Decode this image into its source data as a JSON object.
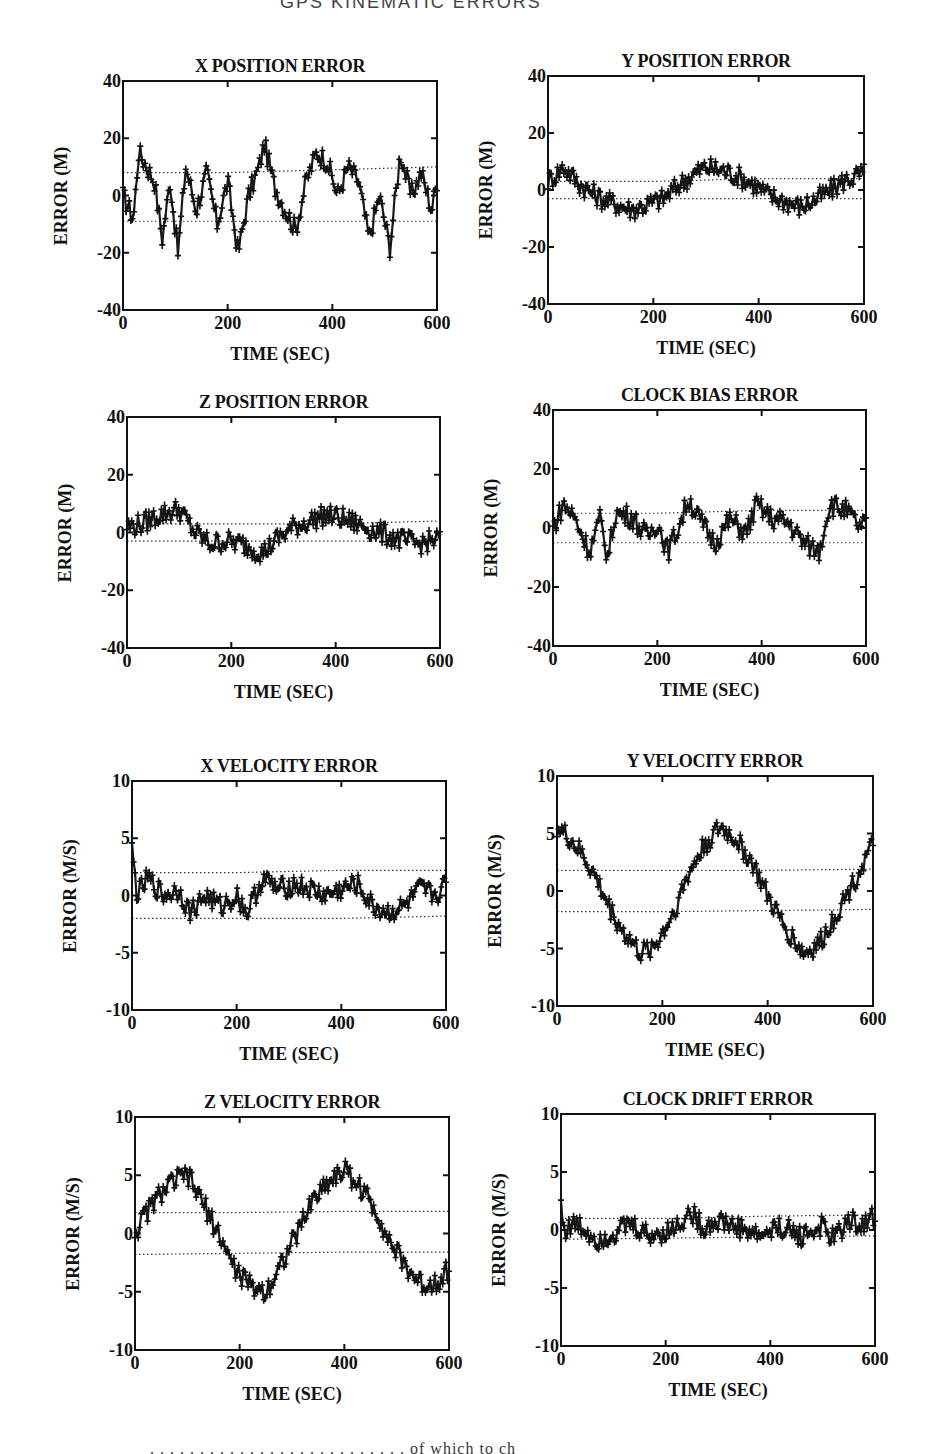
{
  "page": {
    "top_partial_text": "GPS KINEMATIC ERRORS",
    "bottom_partial_text": ". . . . . . . . . . . . . . . . . . . . . . . . . . of which to ch"
  },
  "panels": [
    {
      "id": "x-position",
      "title": "X POSITION ERROR",
      "ylabel": "ERROR (M)",
      "xlabel": "TIME (SEC)",
      "frame": {
        "left": 123,
        "top": 81,
        "right": 437,
        "bottom": 310
      },
      "yticks": [
        "40",
        "20",
        "0",
        "-20",
        "-40"
      ],
      "xticks": [
        "0",
        "200",
        "400",
        "600"
      ]
    },
    {
      "id": "y-position",
      "title": "Y POSITION ERROR",
      "ylabel": "ERROR (M)",
      "xlabel": "TIME (SEC)",
      "frame": {
        "left": 548,
        "top": 76,
        "right": 864,
        "bottom": 304
      },
      "yticks": [
        "40",
        "20",
        "0",
        "-20",
        "-40"
      ],
      "xticks": [
        "0",
        "200",
        "400",
        "600"
      ]
    },
    {
      "id": "z-position",
      "title": "Z POSITION ERROR",
      "ylabel": "ERROR (M)",
      "xlabel": "TIME (SEC)",
      "frame": {
        "left": 127,
        "top": 417,
        "right": 440,
        "bottom": 648
      },
      "yticks": [
        "40",
        "20",
        "0",
        "-20",
        "-40"
      ],
      "xticks": [
        "0",
        "200",
        "400",
        "600"
      ]
    },
    {
      "id": "clock-bias",
      "title": "CLOCK BIAS ERROR",
      "ylabel": "ERROR (M)",
      "xlabel": "TIME (SEC)",
      "frame": {
        "left": 553,
        "top": 410,
        "right": 866,
        "bottom": 646
      },
      "yticks": [
        "40",
        "20",
        "0",
        "-20",
        "-40"
      ],
      "xticks": [
        "0",
        "200",
        "400",
        "600"
      ]
    },
    {
      "id": "x-velocity",
      "title": "X VELOCITY ERROR",
      "ylabel": "ERROR (M/S)",
      "xlabel": "TIME (SEC)",
      "frame": {
        "left": 132,
        "top": 781,
        "right": 446,
        "bottom": 1010
      },
      "yticks": [
        "10",
        "5",
        "0",
        "-5",
        "-10"
      ],
      "xticks": [
        "0",
        "200",
        "400",
        "600"
      ]
    },
    {
      "id": "y-velocity",
      "title": "Y VELOCITY ERROR",
      "ylabel": "ERROR (M/S)",
      "xlabel": "TIME (SEC)",
      "frame": {
        "left": 557,
        "top": 776,
        "right": 873,
        "bottom": 1006
      },
      "yticks": [
        "10",
        "5",
        "0",
        "-5",
        "-10"
      ],
      "xticks": [
        "0",
        "200",
        "400",
        "600"
      ]
    },
    {
      "id": "z-velocity",
      "title": "Z VELOCITY ERROR",
      "ylabel": "ERROR (M/S)",
      "xlabel": "TIME (SEC)",
      "frame": {
        "left": 135,
        "top": 1117,
        "right": 449,
        "bottom": 1350
      },
      "yticks": [
        "10",
        "5",
        "0",
        "-5",
        "-10"
      ],
      "xticks": [
        "0",
        "200",
        "400",
        "600"
      ]
    },
    {
      "id": "clock-drift",
      "title": "CLOCK DRIFT ERROR",
      "ylabel": "ERROR (M/S)",
      "xlabel": "TIME (SEC)",
      "frame": {
        "left": 561,
        "top": 1114,
        "right": 875,
        "bottom": 1346
      },
      "yticks": [
        "10",
        "5",
        "0",
        "-5",
        "-10"
      ],
      "xticks": [
        "0",
        "200",
        "400",
        "600"
      ]
    }
  ],
  "chart_data": [
    {
      "type": "line",
      "title": "X POSITION ERROR",
      "xlabel": "TIME (SEC)",
      "ylabel": "ERROR (M)",
      "xlim": [
        0,
        600
      ],
      "ylim": [
        -40,
        40
      ],
      "grid": false,
      "marker": "+",
      "x": [
        0,
        20,
        30,
        40,
        60,
        75,
        90,
        105,
        120,
        140,
        160,
        180,
        200,
        220,
        240,
        260,
        270,
        290,
        310,
        330,
        350,
        370,
        390,
        410,
        430,
        450,
        470,
        490,
        510,
        530,
        550,
        570,
        590,
        600
      ],
      "values": [
        0,
        -8,
        15,
        12,
        5,
        -15,
        5,
        -20,
        10,
        -5,
        8,
        -10,
        5,
        -20,
        0,
        10,
        18,
        3,
        -5,
        -12,
        5,
        15,
        12,
        0,
        10,
        5,
        -15,
        0,
        -18,
        15,
        0,
        8,
        -5,
        5
      ],
      "bounds": {
        "upper": [
          8,
          8,
          9,
          10
        ],
        "lower": [
          -9,
          -9,
          -9,
          -9
        ],
        "upper_label": "+1 sigma",
        "x_bounds": [
          0,
          200,
          400,
          600
        ]
      }
    },
    {
      "type": "line",
      "title": "Y POSITION ERROR",
      "xlabel": "TIME (SEC)",
      "ylabel": "ERROR (M)",
      "xlim": [
        0,
        600
      ],
      "ylim": [
        -40,
        40
      ],
      "grid": false,
      "marker": "+",
      "x": [
        0,
        30,
        60,
        100,
        130,
        160,
        190,
        220,
        250,
        280,
        300,
        330,
        360,
        390,
        420,
        450,
        480,
        500,
        530,
        560,
        600
      ],
      "values": [
        3,
        8,
        2,
        -3,
        -5,
        -7,
        -5,
        -3,
        2,
        6,
        8,
        7,
        5,
        2,
        -2,
        -4,
        -6,
        -4,
        -1,
        3,
        6
      ],
      "bounds": {
        "upper": [
          3,
          3,
          4,
          4
        ],
        "lower": [
          -3,
          -3,
          -3,
          -3
        ],
        "x_bounds": [
          0,
          200,
          400,
          600
        ]
      }
    },
    {
      "type": "line",
      "title": "Z POSITION ERROR",
      "xlabel": "TIME (SEC)",
      "ylabel": "ERROR (M)",
      "xlim": [
        0,
        600
      ],
      "ylim": [
        -40,
        40
      ],
      "grid": false,
      "marker": "+",
      "x": [
        0,
        30,
        60,
        100,
        130,
        160,
        190,
        220,
        260,
        290,
        320,
        350,
        380,
        410,
        440,
        470,
        500,
        530,
        560,
        600
      ],
      "values": [
        2,
        3,
        6,
        8,
        0,
        -4,
        -3,
        -4,
        -7,
        -2,
        2,
        4,
        6,
        5,
        3,
        1,
        -1,
        -3,
        -4,
        -2
      ],
      "bounds": {
        "upper": [
          3,
          3,
          3,
          4
        ],
        "lower": [
          -3,
          -3,
          -3,
          -3
        ],
        "x_bounds": [
          0,
          200,
          400,
          600
        ]
      }
    },
    {
      "type": "line",
      "title": "CLOCK BIAS ERROR",
      "xlabel": "TIME (SEC)",
      "ylabel": "ERROR (M)",
      "xlim": [
        0,
        600
      ],
      "ylim": [
        -40,
        40
      ],
      "grid": false,
      "marker": "+",
      "x": [
        0,
        20,
        40,
        70,
        90,
        105,
        120,
        150,
        180,
        200,
        220,
        240,
        260,
        280,
        310,
        340,
        370,
        390,
        420,
        450,
        480,
        510,
        530,
        560,
        590,
        600
      ],
      "values": [
        0,
        8,
        4,
        -8,
        3,
        -10,
        5,
        4,
        -3,
        2,
        -8,
        0,
        10,
        3,
        -5,
        3,
        -2,
        8,
        3,
        2,
        -5,
        -8,
        8,
        6,
        0,
        2
      ],
      "bounds": {
        "upper": [
          5,
          5,
          6,
          6
        ],
        "lower": [
          -5,
          -5,
          -5,
          -5
        ],
        "x_bounds": [
          0,
          200,
          400,
          600
        ]
      }
    },
    {
      "type": "line",
      "title": "X VELOCITY ERROR",
      "xlabel": "TIME (SEC)",
      "ylabel": "ERROR (M/S)",
      "xlim": [
        0,
        600
      ],
      "ylim": [
        -10,
        10
      ],
      "grid": false,
      "marker": "+",
      "x": [
        0,
        10,
        30,
        60,
        90,
        110,
        140,
        170,
        200,
        220,
        250,
        280,
        310,
        340,
        370,
        400,
        430,
        460,
        490,
        520,
        550,
        580,
        600
      ],
      "values": [
        4,
        0,
        1.5,
        0,
        0.5,
        -1.5,
        0,
        -1,
        0,
        -1.5,
        1.5,
        0.5,
        1,
        0.5,
        0,
        0.5,
        1,
        -1,
        -1.5,
        -1,
        0.5,
        0,
        1
      ],
      "bounds": {
        "upper": [
          2,
          2,
          2.2,
          2.2
        ],
        "lower": [
          -2,
          -2,
          -2,
          -1.8
        ],
        "x_bounds": [
          0,
          200,
          400,
          600
        ]
      }
    },
    {
      "type": "line",
      "title": "Y VELOCITY ERROR",
      "xlabel": "TIME (SEC)",
      "ylabel": "ERROR (M/S)",
      "xlim": [
        0,
        600
      ],
      "ylim": [
        -10,
        10
      ],
      "grid": false,
      "marker": "+",
      "x": [
        0,
        25,
        50,
        75,
        100,
        125,
        160,
        190,
        220,
        250,
        280,
        310,
        340,
        370,
        400,
        430,
        470,
        500,
        530,
        560,
        600
      ],
      "values": [
        5.5,
        4.5,
        3,
        1,
        -1.5,
        -3.5,
        -5.5,
        -4.5,
        -2,
        1.5,
        4,
        5.5,
        4.5,
        2.5,
        -0.5,
        -3,
        -5.5,
        -4.5,
        -2,
        0.5,
        4
      ],
      "bounds": {
        "upper": [
          1.8,
          1.8,
          1.8,
          1.9
        ],
        "lower": [
          -1.8,
          -1.8,
          -1.7,
          -1.6
        ],
        "x_bounds": [
          0,
          200,
          400,
          600
        ]
      }
    },
    {
      "type": "line",
      "title": "Z VELOCITY ERROR",
      "xlabel": "TIME (SEC)",
      "ylabel": "ERROR (M/S)",
      "xlim": [
        0,
        600
      ],
      "ylim": [
        -10,
        10
      ],
      "grid": false,
      "marker": "+",
      "x": [
        0,
        25,
        50,
        75,
        100,
        125,
        160,
        190,
        220,
        250,
        280,
        310,
        340,
        370,
        400,
        430,
        460,
        490,
        520,
        550,
        580,
        600
      ],
      "values": [
        0,
        2,
        3.5,
        4.5,
        5,
        3,
        0,
        -3,
        -4.5,
        -5,
        -2.5,
        0,
        3,
        4.5,
        5.5,
        4,
        2,
        -1,
        -3,
        -4.5,
        -4,
        -3
      ],
      "bounds": {
        "upper": [
          1.8,
          1.8,
          1.9,
          1.9
        ],
        "lower": [
          -1.8,
          -1.7,
          -1.6,
          -1.6
        ],
        "x_bounds": [
          0,
          200,
          400,
          600
        ]
      }
    },
    {
      "type": "line",
      "title": "CLOCK DRIFT ERROR",
      "xlabel": "TIME (SEC)",
      "ylabel": "ERROR (M/S)",
      "xlim": [
        0,
        600
      ],
      "ylim": [
        -10,
        10
      ],
      "grid": false,
      "marker": "+",
      "x": [
        0,
        5,
        30,
        70,
        100,
        130,
        170,
        210,
        250,
        270,
        300,
        340,
        380,
        420,
        460,
        500,
        520,
        550,
        580,
        600
      ],
      "values": [
        2.5,
        0,
        0.5,
        -0.8,
        -0.3,
        0.5,
        -0.5,
        0,
        1.5,
        0.2,
        0.8,
        0.2,
        -0.5,
        0.3,
        -0.5,
        0.3,
        -0.8,
        0.8,
        0.5,
        1.2
      ],
      "bounds": {
        "upper": [
          1,
          1,
          1.2,
          1.3
        ],
        "lower": [
          -0.8,
          -0.7,
          -0.6,
          -0.5
        ],
        "x_bounds": [
          0,
          200,
          400,
          600
        ]
      }
    }
  ]
}
